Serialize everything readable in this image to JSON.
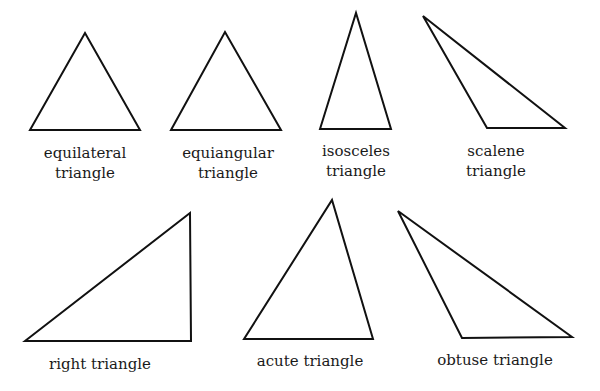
{
  "stroke_color": "#111111",
  "triangles": [
    {
      "id": "equilateral",
      "label": [
        "equilateral",
        "triangle"
      ],
      "points": "30,130 85,33 140,130",
      "label_x": 85,
      "label_y": 143
    },
    {
      "id": "equiangular",
      "label": [
        "equiangular",
        "triangle"
      ],
      "points": "171,130 225,32 281,130",
      "label_x": 228,
      "label_y": 143
    },
    {
      "id": "isosceles",
      "label": [
        "isosceles",
        "triangle"
      ],
      "points": "320,129 356,13 391,129",
      "label_x": 356,
      "label_y": 141
    },
    {
      "id": "scalene",
      "label": [
        "scalene",
        "triangle"
      ],
      "points": "423,16 487,128 565,128",
      "label_x": 496,
      "label_y": 141
    },
    {
      "id": "right",
      "label": [
        "right triangle"
      ],
      "points": "25,341 190,213 191,341",
      "label_x": 100,
      "label_y": 354
    },
    {
      "id": "acute",
      "label": [
        "acute triangle"
      ],
      "points": "244,339 332,200 373,339",
      "label_x": 310,
      "label_y": 351
    },
    {
      "id": "obtuse",
      "label": [
        "obtuse triangle"
      ],
      "points": "398,211 462,338 572,337",
      "label_x": 495,
      "label_y": 350
    }
  ]
}
